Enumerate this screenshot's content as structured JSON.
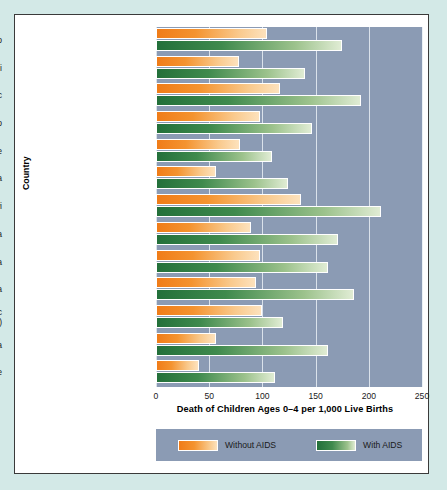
{
  "chart_data": {
    "type": "bar",
    "orientation": "horizontal",
    "title": "",
    "xlabel": "Death of Children Ages 0–4 per 1,000 Live Births",
    "ylabel": "Country",
    "xlim": [
      0,
      250
    ],
    "xticks": [
      0,
      50,
      100,
      150,
      200,
      250
    ],
    "grid": true,
    "legend_position": "bottom",
    "categories": [
      "Burkina Faso",
      "Burundi",
      "Central African Republic",
      "Congo",
      "Côte d'Ivoire",
      "Kenya",
      "Malawi",
      "Rwanda",
      "Tanzania",
      "Uganda",
      "Democratic Republic\nof Congo (Zaire)",
      "Zambia",
      "Zimbabwe"
    ],
    "series": [
      {
        "name": "Without AIDS",
        "color": "#f0821e",
        "values": [
          104,
          78,
          117,
          98,
          79,
          56,
          136,
          89,
          98,
          94,
          100,
          56,
          40
        ]
      },
      {
        "name": "With AIDS",
        "color": "#2a7a3e",
        "values": [
          175,
          140,
          193,
          147,
          109,
          124,
          211,
          171,
          162,
          186,
          119,
          162,
          112
        ]
      }
    ]
  },
  "legend": {
    "without_label": "Without AIDS",
    "with_label": "With AIDS"
  },
  "colors": {
    "page_background": "#d3e9e7",
    "panel_background": "#ffffff",
    "plot_background": "#8b9bb4",
    "gridline": "#e8eef5",
    "orange_dark": "#f07c18",
    "orange_light": "#fde2bd",
    "green_dark": "#23703a",
    "green_light": "#e0ecd4",
    "text": "#1a1a1a"
  }
}
